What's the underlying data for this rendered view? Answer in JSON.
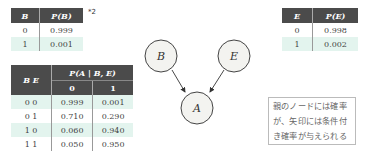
{
  "table_b": {
    "headers": [
      "B",
      "P(B)"
    ],
    "rows": [
      [
        "0",
        "0.999"
      ],
      [
        "1",
        "0.001"
      ]
    ],
    "footnote_mark": "*2"
  },
  "table_e": {
    "headers": [
      "E",
      "P(E)"
    ],
    "rows": [
      [
        "0",
        "0.998"
      ],
      [
        "1",
        "0.002"
      ]
    ]
  },
  "table_a": {
    "row_header": "B E",
    "col_group_header": "P(A | B, E)",
    "col_headers": [
      "0",
      "1"
    ],
    "rows": [
      [
        "0 0",
        "0.999",
        "0.001"
      ],
      [
        "0 1",
        "0.710",
        "0.290"
      ],
      [
        "1 0",
        "0.060",
        "0.940"
      ],
      [
        "1 1",
        "0.050",
        "0.950"
      ]
    ]
  },
  "graph": {
    "nodes": [
      {
        "id": "B",
        "label": "B"
      },
      {
        "id": "E",
        "label": "E"
      },
      {
        "id": "A",
        "label": "A"
      }
    ],
    "edges": [
      [
        "B",
        "A"
      ],
      [
        "E",
        "A"
      ]
    ]
  },
  "note": {
    "lines": [
      "親のノードには確率",
      "が、矢印には条件付",
      "き確率が与えられる"
    ]
  },
  "colors": {
    "header_bg": "#4b4b4b",
    "alt_row_bg": "#e3f4ee",
    "node_fill": "#f3f3f0"
  }
}
